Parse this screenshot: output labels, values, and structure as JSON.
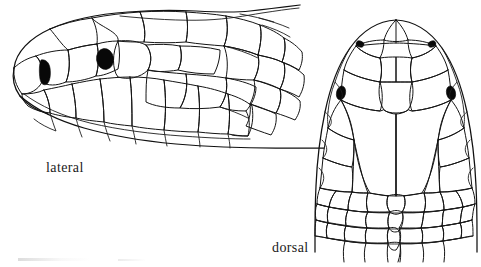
{
  "figure": {
    "kind": "scientific-line-illustration",
    "background_color": "#ffffff",
    "ink_color": "#141414",
    "width": 481,
    "height": 267,
    "views": [
      {
        "id": "lateral",
        "label": "lateral",
        "description": "Side view of snake head facing left, showing head shields, labial scales and imbricate neck scales",
        "features": [
          "eye",
          "nostril",
          "supralabials",
          "infralabials",
          "temporals",
          "neck-scales"
        ]
      },
      {
        "id": "dorsal",
        "label": "dorsal",
        "description": "Top view of snake head, snout upward, showing paired symmetrical head shields",
        "features": [
          "rostral",
          "internasals",
          "prefrontals",
          "frontal",
          "supraoculars",
          "parietals",
          "nape-scales",
          "eyes",
          "nostrils"
        ]
      }
    ]
  },
  "captions": {
    "lateral": "lateral",
    "dorsal": "dorsal"
  },
  "marks": {
    "eye_fill": "#080808",
    "nostril_fill": "#080808"
  }
}
